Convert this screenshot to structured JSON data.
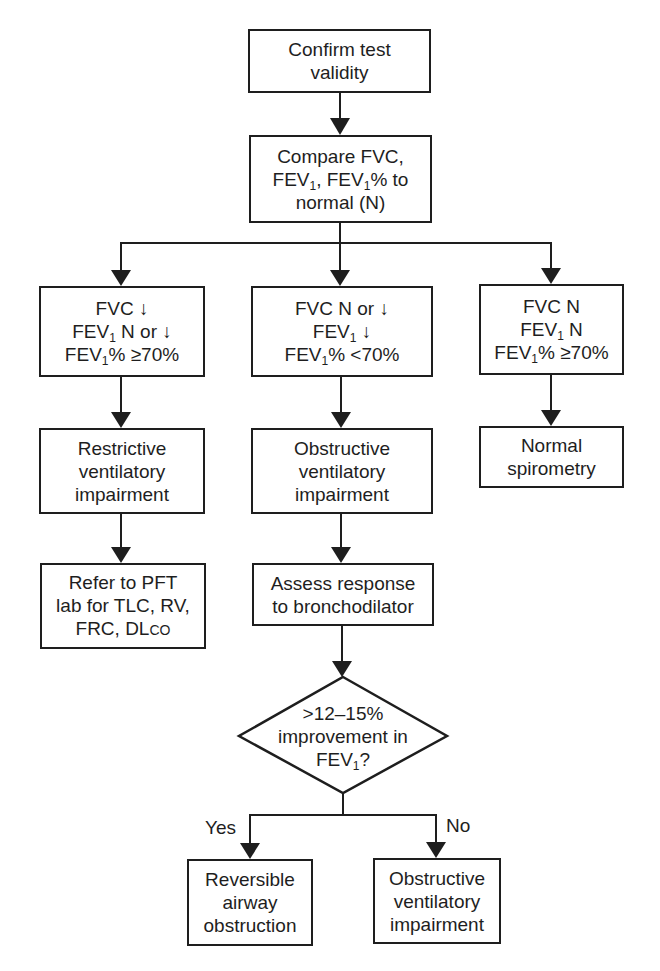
{
  "diagram": {
    "type": "flowchart",
    "colors": {
      "stroke": "#1e1e1e",
      "fill": "#ffffff",
      "text": "#1e1e1e"
    },
    "nodes": {
      "confirm": {
        "lines": [
          "Confirm test",
          "validity"
        ]
      },
      "compare": {
        "l1": "Compare FVC,",
        "l2a": "FEV",
        "l2sub": "1",
        "l2b": ", FEV",
        "l2sub2": "1",
        "l2c": "% to",
        "l3": "normal (N)"
      },
      "restrict_crit": {
        "l1": "FVC ↓",
        "l2a": "FEV",
        "l2sub": "1",
        "l2b": " N or ↓",
        "l3a": "FEV",
        "l3sub": "1",
        "l3b": "% ≥70%"
      },
      "obstruct_crit": {
        "l1": "FVC N or ↓",
        "l2a": "FEV",
        "l2sub": "1",
        "l2b": " ↓",
        "l3a": "FEV",
        "l3sub": "1",
        "l3b": "% <70%"
      },
      "normal_crit": {
        "l1": "FVC N",
        "l2a": "FEV",
        "l2sub": "1",
        "l2b": " N",
        "l3a": "FEV",
        "l3sub": "1",
        "l3b": "% ≥70%"
      },
      "restrictive": {
        "lines": [
          "Restrictive",
          "ventilatory",
          "impairment"
        ]
      },
      "obstructive": {
        "lines": [
          "Obstructive",
          "ventilatory",
          "impairment"
        ]
      },
      "normal": {
        "lines": [
          "Normal",
          "spirometry"
        ]
      },
      "refer": {
        "l1": "Refer to PFT",
        "l2": "lab for TLC, RV,",
        "l3a": "FRC, DL",
        "l3sc": "CO"
      },
      "assess": {
        "lines": [
          "Assess response",
          "to bronchodilator"
        ]
      },
      "decision": {
        "l1": ">12–15%",
        "l2": "improvement in",
        "l3a": "FEV",
        "l3sub": "1",
        "l3b": "?"
      },
      "reversible": {
        "lines": [
          "Reversible",
          "airway",
          "obstruction"
        ]
      },
      "obstructive2": {
        "lines": [
          "Obstructive",
          "ventilatory",
          "impairment"
        ]
      }
    },
    "edge_labels": {
      "yes": "Yes",
      "no": "No"
    },
    "edges": [
      [
        "confirm",
        "compare"
      ],
      [
        "compare",
        "restrict_crit"
      ],
      [
        "compare",
        "obstruct_crit"
      ],
      [
        "compare",
        "normal_crit"
      ],
      [
        "restrict_crit",
        "restrictive"
      ],
      [
        "restrictive",
        "refer"
      ],
      [
        "obstruct_crit",
        "obstructive"
      ],
      [
        "obstructive",
        "assess"
      ],
      [
        "assess",
        "decision"
      ],
      [
        "normal_crit",
        "normal"
      ],
      [
        "decision",
        "reversible",
        "Yes"
      ],
      [
        "decision",
        "obstructive2",
        "No"
      ]
    ]
  }
}
